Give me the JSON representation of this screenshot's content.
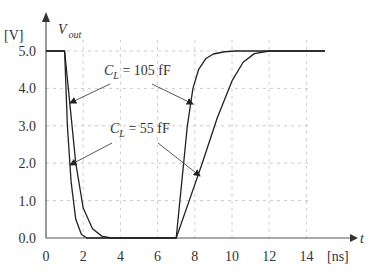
{
  "chart_data": {
    "type": "line",
    "title": "",
    "xlabel": "t [ns]",
    "ylabel": "V_out [V]",
    "y_unit": "[V]",
    "x_unit": "[ns]",
    "y_axis_label": "V",
    "y_axis_sub": "out",
    "x_axis_label": "t",
    "xlim": [
      0,
      15
    ],
    "ylim": [
      0,
      5
    ],
    "x_ticks": [
      "0",
      "2",
      "4",
      "6",
      "8",
      "10",
      "12",
      "14"
    ],
    "y_ticks": [
      "0.0",
      "1.0",
      "2.0",
      "3.0",
      "4.0",
      "5.0"
    ],
    "grid": true,
    "series": [
      {
        "name": "C_L = 105 fF",
        "x": [
          0,
          1,
          1.3,
          1.6,
          2.0,
          2.5,
          3.0,
          3.5,
          7.0,
          7.3,
          7.6,
          7.9,
          8.2,
          8.6,
          9.0,
          9.6,
          10.2,
          15
        ],
        "y": [
          5.0,
          5.0,
          3.5,
          2.0,
          0.8,
          0.25,
          0.05,
          0.0,
          0.0,
          1.5,
          3.0,
          4.0,
          4.5,
          4.8,
          4.92,
          4.98,
          5.0,
          5.0
        ]
      },
      {
        "name": "C_L = 55 fF",
        "x": [
          0,
          1,
          1.15,
          1.35,
          1.6,
          1.9,
          2.2,
          7.0,
          7.7,
          8.4,
          9.2,
          10.0,
          10.6,
          11.2,
          12.0,
          15
        ],
        "y": [
          5.0,
          5.0,
          3.0,
          1.5,
          0.5,
          0.1,
          0.0,
          0.0,
          1.0,
          2.0,
          3.2,
          4.2,
          4.7,
          4.93,
          5.0,
          5.0
        ]
      }
    ],
    "annotations": [
      {
        "text": "C_L = 105 fF",
        "main": "C",
        "sub": "L",
        "rest": " = 105 fF"
      },
      {
        "text": "C_L = 55 fF",
        "main": "C",
        "sub": "L",
        "rest": " = 55 fF"
      }
    ]
  }
}
